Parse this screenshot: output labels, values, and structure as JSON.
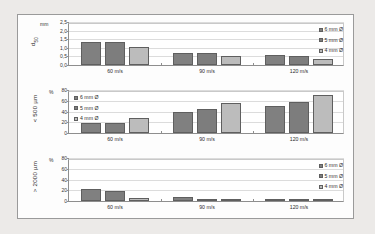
{
  "figure": {
    "background": "#eceae8",
    "panel_background": "#ffffff",
    "series_colors": [
      "#808080",
      "#7d7d7d",
      "#bcbcbc"
    ]
  },
  "legend_labels": {
    "s6": "6 mm Ø",
    "s5": "5 mm Ø",
    "s4": "4 mm Ø"
  },
  "chart_data": [
    {
      "type": "bar",
      "title": "",
      "ylabel": "d50",
      "ylabel_sub": "50",
      "ylabel_main": "d",
      "yunit": "mm",
      "xlabel": "",
      "categories": [
        "60 m/s",
        "90 m/s",
        "120 m/s"
      ],
      "series": [
        {
          "name": "6 mm Ø",
          "values": [
            1.35,
            0.72,
            0.58
          ]
        },
        {
          "name": "5 mm Ø",
          "values": [
            1.33,
            0.68,
            0.52
          ]
        },
        {
          "name": "4 mm Ø",
          "values": [
            1.05,
            0.5,
            0.33
          ]
        }
      ],
      "ylim": [
        0,
        2.5
      ],
      "yticks": [
        "0,0",
        "0,5",
        "1,0",
        "1,5",
        "2,0",
        "2,5"
      ],
      "ytick_values": [
        0,
        0.5,
        1.0,
        1.5,
        2.0,
        2.5
      ],
      "grid": true,
      "legend_position": "top-right"
    },
    {
      "type": "bar",
      "title": "",
      "ylabel": "< 500 µm",
      "yunit": "%",
      "xlabel": "",
      "categories": [
        "60 m/s",
        "90 m/s",
        "120 m/s"
      ],
      "series": [
        {
          "name": "6 mm Ø",
          "values": [
            18,
            40,
            51
          ]
        },
        {
          "name": "5 mm Ø",
          "values": [
            19,
            44,
            58
          ]
        },
        {
          "name": "4 mm Ø",
          "values": [
            28,
            56,
            71
          ]
        }
      ],
      "ylim": [
        0,
        80
      ],
      "yticks": [
        "0",
        "20",
        "40",
        "60",
        "80"
      ],
      "ytick_values": [
        0,
        20,
        40,
        60,
        80
      ],
      "grid": true,
      "legend_position": "top-left"
    },
    {
      "type": "bar",
      "title": "",
      "ylabel": "> 2000 µm",
      "yunit": "%",
      "xlabel": "",
      "categories": [
        "60 m/s",
        "90 m/s",
        "120 m/s"
      ],
      "series": [
        {
          "name": "6 mm Ø",
          "values": [
            23,
            7,
            3
          ]
        },
        {
          "name": "5 mm Ø",
          "values": [
            19,
            3,
            2
          ]
        },
        {
          "name": "4 mm Ø",
          "values": [
            5,
            1,
            1
          ]
        }
      ],
      "ylim": [
        0,
        80
      ],
      "yticks": [
        "0",
        "20",
        "40",
        "60",
        "80"
      ],
      "ytick_values": [
        0,
        20,
        40,
        60,
        80
      ],
      "grid": true,
      "legend_position": "top-right"
    }
  ]
}
